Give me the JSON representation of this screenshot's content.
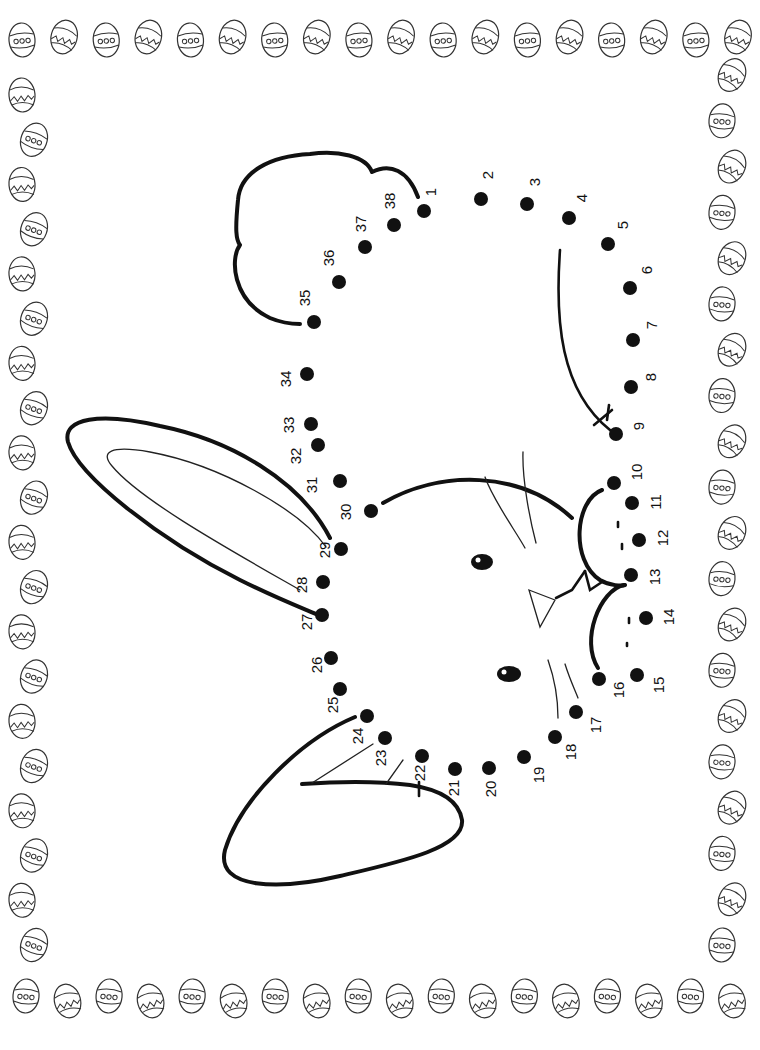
{
  "worksheet": {
    "title": "Easter bunny connect-the-dots",
    "orientation_rotation_deg": -90,
    "dot_color": "#111111",
    "line_color": "#111111",
    "border": {
      "motif": "easter-egg",
      "styles": [
        "dotted-band-egg",
        "zigzag-egg"
      ],
      "top_count": 18,
      "bottom_count": 18,
      "left_count": 20,
      "right_count": 20
    },
    "dots": [
      {
        "n": "1",
        "x": 424,
        "y": 211,
        "lx": 432,
        "ly": 192
      },
      {
        "n": "2",
        "x": 481,
        "y": 199,
        "lx": 489,
        "ly": 175
      },
      {
        "n": "3",
        "x": 527,
        "y": 204,
        "lx": 536,
        "ly": 182
      },
      {
        "n": "4",
        "x": 569,
        "y": 218,
        "lx": 583,
        "ly": 198
      },
      {
        "n": "5",
        "x": 608,
        "y": 244,
        "lx": 624,
        "ly": 225
      },
      {
        "n": "6",
        "x": 630,
        "y": 288,
        "lx": 648,
        "ly": 270
      },
      {
        "n": "7",
        "x": 633,
        "y": 340,
        "lx": 653,
        "ly": 325
      },
      {
        "n": "8",
        "x": 631,
        "y": 387,
        "lx": 652,
        "ly": 377
      },
      {
        "n": "9",
        "x": 616,
        "y": 434,
        "lx": 640,
        "ly": 426
      },
      {
        "n": "10",
        "x": 614,
        "y": 483,
        "lx": 638,
        "ly": 472
      },
      {
        "n": "11",
        "x": 632,
        "y": 503,
        "lx": 657,
        "ly": 502
      },
      {
        "n": "12",
        "x": 639,
        "y": 540,
        "lx": 664,
        "ly": 538
      },
      {
        "n": "13",
        "x": 631,
        "y": 575,
        "lx": 656,
        "ly": 577
      },
      {
        "n": "14",
        "x": 646,
        "y": 618,
        "lx": 670,
        "ly": 617
      },
      {
        "n": "15",
        "x": 637,
        "y": 675,
        "lx": 660,
        "ly": 685
      },
      {
        "n": "16",
        "x": 599,
        "y": 679,
        "lx": 620,
        "ly": 690
      },
      {
        "n": "17",
        "x": 576,
        "y": 712,
        "lx": 597,
        "ly": 725
      },
      {
        "n": "18",
        "x": 555,
        "y": 737,
        "lx": 572,
        "ly": 752
      },
      {
        "n": "19",
        "x": 524,
        "y": 757,
        "lx": 540,
        "ly": 775
      },
      {
        "n": "20",
        "x": 489,
        "y": 768,
        "lx": 492,
        "ly": 789
      },
      {
        "n": "21",
        "x": 455,
        "y": 769,
        "lx": 455,
        "ly": 788
      },
      {
        "n": "22",
        "x": 422,
        "y": 756,
        "lx": 421,
        "ly": 773
      },
      {
        "n": "23",
        "x": 385,
        "y": 738,
        "lx": 382,
        "ly": 758
      },
      {
        "n": "24",
        "x": 367,
        "y": 716,
        "lx": 359,
        "ly": 736
      },
      {
        "n": "25",
        "x": 340,
        "y": 689,
        "lx": 334,
        "ly": 705
      },
      {
        "n": "26",
        "x": 331,
        "y": 658,
        "lx": 318,
        "ly": 665
      },
      {
        "n": "27",
        "x": 322,
        "y": 615,
        "lx": 308,
        "ly": 622
      },
      {
        "n": "28",
        "x": 323,
        "y": 582,
        "lx": 303,
        "ly": 585
      },
      {
        "n": "29",
        "x": 341,
        "y": 549,
        "lx": 326,
        "ly": 550
      },
      {
        "n": "30",
        "x": 371,
        "y": 511,
        "lx": 347,
        "ly": 512
      },
      {
        "n": "31",
        "x": 340,
        "y": 481,
        "lx": 313,
        "ly": 485
      },
      {
        "n": "32",
        "x": 318,
        "y": 445,
        "lx": 297,
        "ly": 456
      },
      {
        "n": "33",
        "x": 311,
        "y": 424,
        "lx": 290,
        "ly": 425
      },
      {
        "n": "34",
        "x": 307,
        "y": 374,
        "lx": 287,
        "ly": 379
      },
      {
        "n": "35",
        "x": 314,
        "y": 322,
        "lx": 306,
        "ly": 298
      },
      {
        "n": "36",
        "x": 339,
        "y": 282,
        "lx": 330,
        "ly": 258
      },
      {
        "n": "37",
        "x": 365,
        "y": 247,
        "lx": 362,
        "ly": 224
      },
      {
        "n": "38",
        "x": 394,
        "y": 225,
        "lx": 391,
        "ly": 201
      }
    ]
  }
}
